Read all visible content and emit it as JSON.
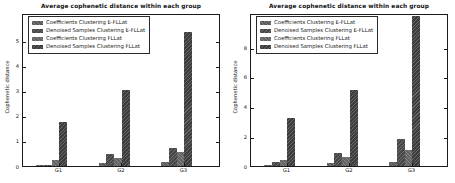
{
  "figure": {
    "background_color": "#ffffff",
    "axes_frame_color": "#1a1a1a",
    "series_colors": [
      "#5b5b5b",
      "#474747",
      "#646464",
      "#3d3d3d"
    ],
    "hatch_style": "diagonal-stripes"
  },
  "chart_data": [
    {
      "type": "bar",
      "title": "Average cophenetic distance within each group",
      "xlabel": "",
      "ylabel": "Cophenetic distance",
      "categories": [
        "G1",
        "G2",
        "G3"
      ],
      "series": [
        {
          "name": "Coefficients Clustering E-FLLat",
          "values": [
            0.05,
            0.13,
            0.18
          ]
        },
        {
          "name": "Denoised Samples Clustering E-FLLat",
          "values": [
            0.05,
            0.48,
            0.72
          ]
        },
        {
          "name": "Coefficients Clustering FLLat",
          "values": [
            0.22,
            0.3,
            0.55
          ]
        },
        {
          "name": "Denoised Samples Clustering FLLat",
          "values": [
            1.75,
            3.05,
            5.35
          ]
        }
      ],
      "yticks": [
        0,
        1,
        2,
        3,
        4,
        5
      ],
      "ylim": [
        0,
        6.1
      ],
      "grid": false,
      "legend_position": "upper left"
    },
    {
      "type": "bar",
      "title": "Average cophenetic distance within each group",
      "xlabel": "",
      "ylabel": "Cophenetic distance",
      "categories": [
        "G1",
        "G2",
        "G3"
      ],
      "series": [
        {
          "name": "Coefficients Clustering E-FLLat",
          "values": [
            0.1,
            0.18,
            0.3
          ]
        },
        {
          "name": "Denoised Samples Clustering E-FLLat",
          "values": [
            0.3,
            0.9,
            1.85
          ]
        },
        {
          "name": "Coefficients Clustering FLLat",
          "values": [
            0.4,
            0.6,
            1.1
          ]
        },
        {
          "name": "Denoised Samples Clustering FLLat",
          "values": [
            3.25,
            5.15,
            10.1
          ]
        }
      ],
      "yticks": [
        0,
        2,
        4,
        6,
        8
      ],
      "ylim": [
        0,
        10.3
      ],
      "grid": false,
      "legend_position": "upper left"
    }
  ]
}
